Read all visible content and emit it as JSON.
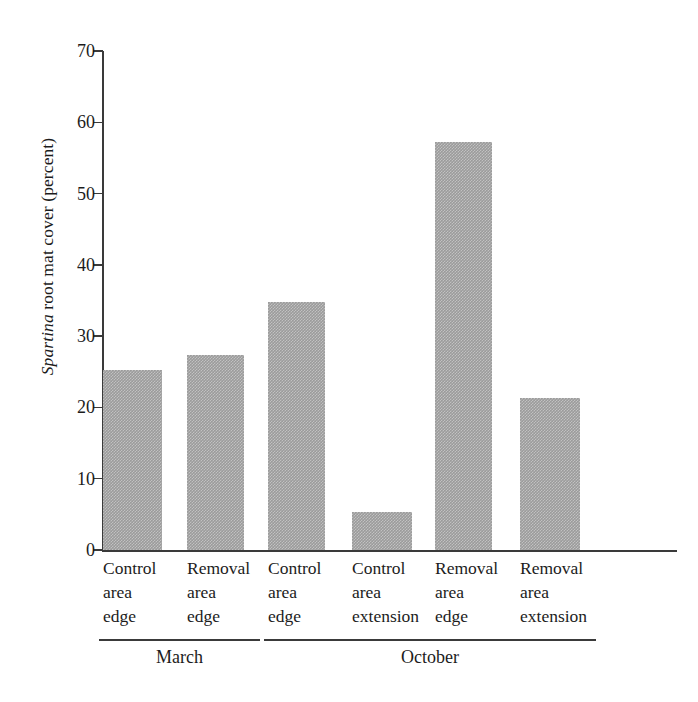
{
  "chart_data": {
    "type": "bar",
    "title": "",
    "xlabel": "",
    "ylabel": "Spartina root mat cover (percent)",
    "ylabel_italic_prefix": "Spartina",
    "ylabel_rest": " root mat cover (percent)",
    "ylim": [
      0,
      70
    ],
    "yticks": [
      0,
      10,
      20,
      30,
      40,
      50,
      60,
      70
    ],
    "ytick_labels": [
      "0",
      "10",
      "20",
      "30",
      "40",
      "50",
      "60",
      "70"
    ],
    "grid": false,
    "legend": null,
    "categories": [
      "Control area edge",
      "Removal area edge",
      "Control area edge",
      "Control area extension",
      "Removal area edge",
      "Removal area extension"
    ],
    "category_lines": [
      [
        "Control",
        "area",
        "edge"
      ],
      [
        "Removal",
        "area",
        "edge"
      ],
      [
        "Control",
        "area",
        "edge"
      ],
      [
        "Control",
        "area",
        "extension"
      ],
      [
        "Removal",
        "area",
        "edge"
      ],
      [
        "Removal",
        "area",
        "extension"
      ]
    ],
    "values": [
      25.2,
      27.3,
      34.8,
      5.3,
      57.2,
      21.3
    ],
    "groups": [
      {
        "label": "March",
        "members": [
          0,
          1
        ]
      },
      {
        "label": "October",
        "members": [
          2,
          3,
          4,
          5
        ]
      }
    ],
    "bar_color": "#9b9b9b",
    "axis_color": "#3a3a3a"
  }
}
